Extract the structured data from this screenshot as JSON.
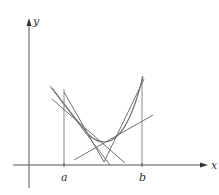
{
  "diagram": {
    "type": "graph-of-convex-function-with-tangent-lines",
    "axes": {
      "x_label": "x",
      "y_label": "y"
    },
    "interval": {
      "left_label": "a",
      "right_label": "b"
    },
    "elements": [
      "x-axis with arrow",
      "y-axis with arrow",
      "vertical line at a",
      "vertical line at b",
      "concave-up curve between a and b",
      "tangent lines to the curve"
    ]
  }
}
